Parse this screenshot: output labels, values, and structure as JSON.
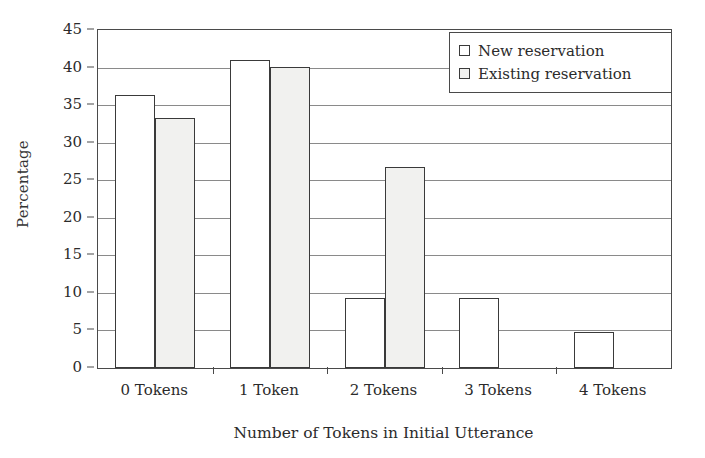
{
  "chart_data": {
    "type": "bar",
    "title": "",
    "xlabel": "Number of Tokens in Initial Utterance",
    "ylabel": "Percentage",
    "categories": [
      "0 Tokens",
      "1 Token",
      "2 Tokens",
      "3 Tokens",
      "4 Tokens"
    ],
    "series": [
      {
        "name": "New reservation",
        "fill": "#ffffff",
        "values": [
          36.4,
          41.0,
          9.3,
          9.3,
          4.8
        ]
      },
      {
        "name": "Existing reservation",
        "fill": "#f1f1ef",
        "values": [
          33.3,
          40.1,
          26.7,
          0,
          0
        ]
      }
    ],
    "ylim": [
      0,
      45
    ],
    "ytick_step": 5,
    "yticks": [
      0,
      5,
      10,
      15,
      20,
      25,
      30,
      35,
      40,
      45
    ],
    "ytick_labels": [
      "0",
      "5",
      "10",
      "15",
      "20",
      "25",
      "30",
      "35",
      "40",
      "45"
    ],
    "grid": "horizontal",
    "legend_position": "top-right",
    "legend_entries": [
      "New reservation",
      "Existing reservation"
    ],
    "annotations": [],
    "colors": {
      "axis": "#4a4a4a",
      "gridline": "#8a8a8a",
      "bar_outline": "#3a3a3a",
      "series_new_fill": "#ffffff",
      "series_existing_fill": "#f1f1ef",
      "text": "#2b2b2b",
      "background": "#ffffff"
    }
  },
  "icons": {
    "legend_marker_new": "square-outline-icon",
    "legend_marker_existing": "square-filled-light-icon"
  }
}
